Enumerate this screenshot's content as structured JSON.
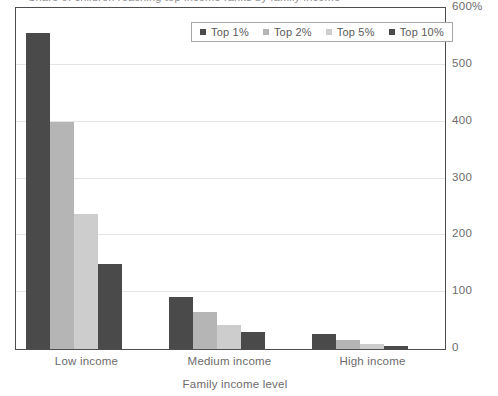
{
  "clipped_title": "Share of children reaching top income ranks by family income",
  "legend": {
    "position": "top-center",
    "entries": [
      {
        "label": "Top 1%",
        "color": "#4a4a4a"
      },
      {
        "label": "Top 2%",
        "color": "#b5b5b5"
      },
      {
        "label": "Top 5%",
        "color": "#cdcdcd"
      },
      {
        "label": "Top 10%",
        "color": "#4a4a4a"
      }
    ]
  },
  "axes": {
    "y_ticks": [
      "600%",
      "500",
      "400",
      "300",
      "200",
      "100",
      "0"
    ],
    "y_tick_values": [
      600,
      500,
      400,
      300,
      200,
      100,
      0
    ],
    "x_categories": [
      "Low income",
      "Medium income",
      "High income"
    ],
    "x_title": "Family income level"
  },
  "chart_data": {
    "type": "bar",
    "title": "",
    "xlabel": "Family income level",
    "ylabel": "",
    "categories": [
      "Low income",
      "Medium income",
      "High income"
    ],
    "series": [
      {
        "name": "Top 1%",
        "color": "#4a4a4a",
        "values": [
          556,
          91,
          26
        ]
      },
      {
        "name": "Top 2%",
        "color": "#b5b5b5",
        "values": [
          400,
          65,
          16
        ]
      },
      {
        "name": "Top 5%",
        "color": "#cdcdcd",
        "values": [
          238,
          42,
          9
        ]
      },
      {
        "name": "Top 10%",
        "color": "#4a4a4a",
        "values": [
          150,
          30,
          5
        ]
      }
    ],
    "ylim": [
      0,
      600
    ],
    "ytick_step": 100,
    "yunit": "%",
    "grid": true,
    "legend_position": "top-center",
    "yaxis_side": "right"
  },
  "colors": {
    "frame": "#4d4d4d",
    "gridline": "#e4e4e4",
    "text": "#6b6b6b",
    "background": "#ffffff"
  }
}
